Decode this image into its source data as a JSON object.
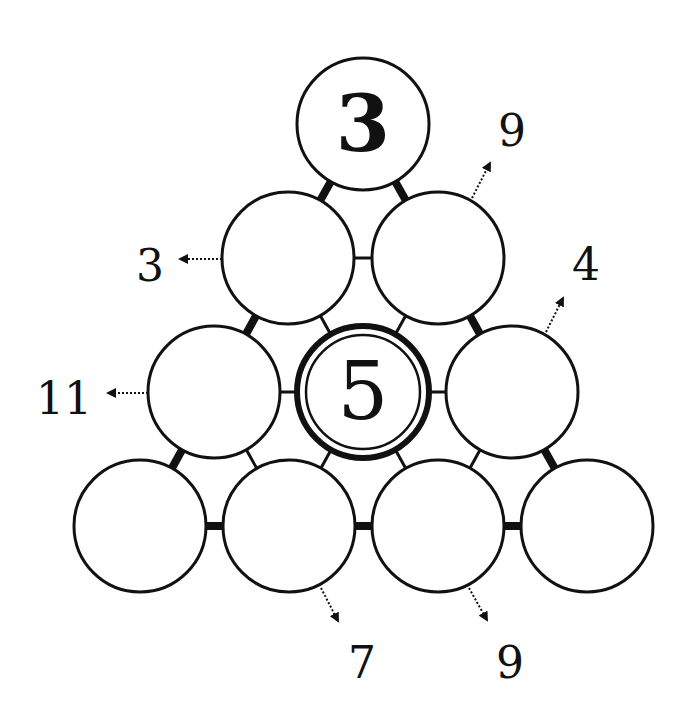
{
  "puzzle": {
    "type": "number-pyramid",
    "colors": {
      "background": "#ffffff",
      "ink": "#111111"
    },
    "radius": 66,
    "cells": [
      {
        "id": "r0c0",
        "row": 0,
        "col": 0,
        "cx": 363,
        "cy": 124,
        "value": "3",
        "style": "given"
      },
      {
        "id": "r1c0",
        "row": 1,
        "col": 0,
        "cx": 288,
        "cy": 258,
        "value": "",
        "style": "empty"
      },
      {
        "id": "r1c1",
        "row": 1,
        "col": 1,
        "cx": 438,
        "cy": 258,
        "value": "",
        "style": "empty"
      },
      {
        "id": "r2c0",
        "row": 2,
        "col": 0,
        "cx": 214,
        "cy": 392,
        "value": "",
        "style": "empty"
      },
      {
        "id": "r2c1",
        "row": 2,
        "col": 1,
        "cx": 363,
        "cy": 392,
        "value": "5",
        "style": "double"
      },
      {
        "id": "r2c2",
        "row": 2,
        "col": 2,
        "cx": 512,
        "cy": 392,
        "value": "",
        "style": "empty"
      },
      {
        "id": "r3c0",
        "row": 3,
        "col": 0,
        "cx": 140,
        "cy": 526,
        "value": "",
        "style": "empty"
      },
      {
        "id": "r3c1",
        "row": 3,
        "col": 1,
        "cx": 289,
        "cy": 526,
        "value": "",
        "style": "empty"
      },
      {
        "id": "r3c2",
        "row": 3,
        "col": 2,
        "cx": 438,
        "cy": 526,
        "value": "",
        "style": "empty"
      },
      {
        "id": "r3c3",
        "row": 3,
        "col": 3,
        "cx": 587,
        "cy": 526,
        "value": "",
        "style": "empty"
      }
    ],
    "clues": [
      {
        "id": "clue-r1c0",
        "value": "3",
        "x": 150,
        "y": 281,
        "arrow": {
          "x1": 222,
          "y1": 259,
          "x2": 180,
          "y2": 259
        }
      },
      {
        "id": "clue-r2c0",
        "value": "11",
        "x": 64,
        "y": 414,
        "arrow": {
          "x1": 148,
          "y1": 393,
          "x2": 108,
          "y2": 393
        }
      },
      {
        "id": "clue-r1c1",
        "value": "9",
        "x": 512,
        "y": 146,
        "arrow": {
          "x1": 472,
          "y1": 198,
          "x2": 490,
          "y2": 163
        }
      },
      {
        "id": "clue-r2c2",
        "value": "4",
        "x": 586,
        "y": 280,
        "arrow": {
          "x1": 546,
          "y1": 332,
          "x2": 563,
          "y2": 298
        }
      },
      {
        "id": "clue-r3c1",
        "value": "7",
        "x": 362,
        "y": 678,
        "arrow": {
          "x1": 321,
          "y1": 588,
          "x2": 338,
          "y2": 621
        }
      },
      {
        "id": "clue-r3c2",
        "value": "9",
        "x": 510,
        "y": 678,
        "arrow": {
          "x1": 469,
          "y1": 588,
          "x2": 487,
          "y2": 620
        }
      }
    ],
    "connectors": [
      {
        "a": "r0c0",
        "b": "r1c0",
        "thick": true
      },
      {
        "a": "r0c0",
        "b": "r1c1",
        "thick": true
      },
      {
        "a": "r1c0",
        "b": "r1c1",
        "thick": false
      },
      {
        "a": "r1c0",
        "b": "r2c0",
        "thick": true
      },
      {
        "a": "r1c0",
        "b": "r2c1",
        "thick": false
      },
      {
        "a": "r1c1",
        "b": "r2c1",
        "thick": false
      },
      {
        "a": "r1c1",
        "b": "r2c2",
        "thick": true
      },
      {
        "a": "r2c0",
        "b": "r2c1",
        "thick": false
      },
      {
        "a": "r2c1",
        "b": "r2c2",
        "thick": false
      },
      {
        "a": "r2c0",
        "b": "r3c0",
        "thick": true
      },
      {
        "a": "r2c0",
        "b": "r3c1",
        "thick": false
      },
      {
        "a": "r2c1",
        "b": "r3c1",
        "thick": false
      },
      {
        "a": "r2c1",
        "b": "r3c2",
        "thick": false
      },
      {
        "a": "r2c2",
        "b": "r3c2",
        "thick": false
      },
      {
        "a": "r2c2",
        "b": "r3c3",
        "thick": true
      },
      {
        "a": "r3c0",
        "b": "r3c1",
        "thick": true
      },
      {
        "a": "r3c1",
        "b": "r3c2",
        "thick": true
      },
      {
        "a": "r3c2",
        "b": "r3c3",
        "thick": true
      }
    ]
  }
}
